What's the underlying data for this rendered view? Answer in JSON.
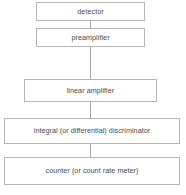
{
  "diagram": {
    "type": "vertical-flowchart",
    "background_color": "#ffffff",
    "border_color": "#b5b5b5",
    "text_color": "#4a4a4a",
    "connector_color": "#a9a9a9",
    "nodes": [
      {
        "id": "detector",
        "label": "detector",
        "x": 36,
        "y": 2,
        "width": 109,
        "height": 19
      },
      {
        "id": "preamplifier",
        "label": "preamplifier",
        "x": 36,
        "y": 28,
        "width": 109,
        "height": 19
      },
      {
        "id": "linear-amplifier",
        "label": "linear amplifier",
        "x": 24,
        "y": 79,
        "width": 133,
        "height": 23
      },
      {
        "id": "discriminator",
        "label": "integral (or differential) discriminator",
        "x": 4,
        "y": 118,
        "width": 176,
        "height": 26
      },
      {
        "id": "counter",
        "label": "counter (or count rate meter)",
        "x": 4,
        "y": 157,
        "width": 176,
        "height": 28
      }
    ],
    "connectors": [
      {
        "id": "detector-to-preamplifier",
        "from": "detector",
        "to": "preamplifier",
        "x": 90,
        "y": 21,
        "length": 7
      },
      {
        "id": "preamplifier-to-linear-amplifier",
        "from": "preamplifier",
        "to": "linear-amplifier",
        "x": 90,
        "y": 47,
        "length": 32
      },
      {
        "id": "linear-amplifier-to-discriminator",
        "from": "linear-amplifier",
        "to": "discriminator",
        "x": 90,
        "y": 102,
        "length": 16
      },
      {
        "id": "discriminator-to-counter",
        "from": "discriminator",
        "to": "counter",
        "x": 90,
        "y": 144,
        "length": 13
      }
    ]
  }
}
